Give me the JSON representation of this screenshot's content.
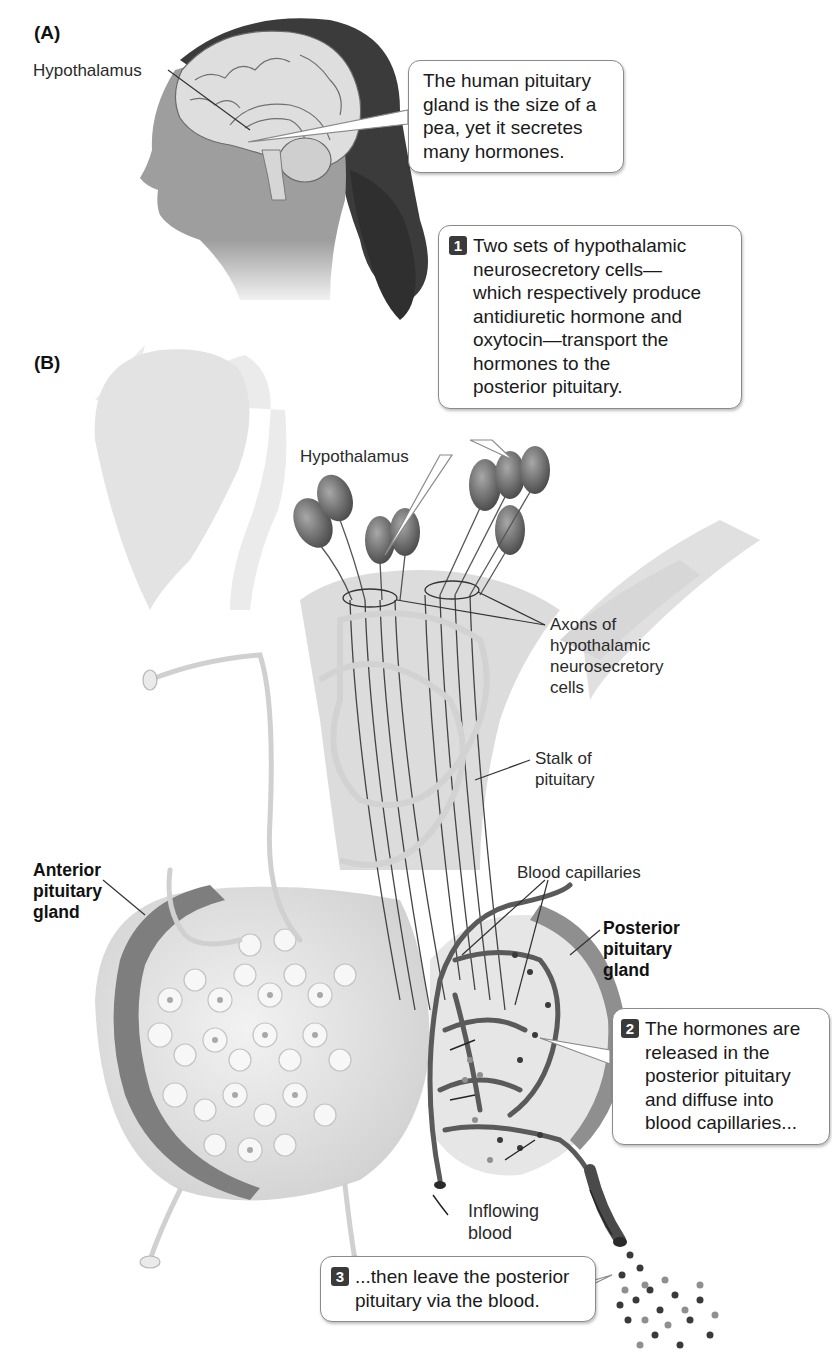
{
  "panels": {
    "a": {
      "letter": "(A)",
      "labels": {
        "hypothalamus": "Hypothalamus"
      },
      "callout": {
        "lines": [
          "The human pituitary",
          "gland is the size of a",
          "pea, yet it secretes",
          "many hormones."
        ]
      }
    },
    "b": {
      "letter": "(B)",
      "labels": {
        "hypothalamus": "Hypothalamus",
        "axons": [
          "Axons of",
          "hypothalamic",
          "neurosecretory",
          "cells"
        ],
        "stalk": [
          "Stalk of",
          "pituitary"
        ],
        "anterior": [
          "Anterior",
          "pituitary",
          "gland"
        ],
        "posterior": [
          "Posterior",
          "pituitary",
          "gland"
        ],
        "capillaries": "Blood capillaries",
        "inflowing": [
          "Inflowing",
          "blood"
        ]
      },
      "steps": [
        {
          "number": "1",
          "lines": [
            "Two sets of hypothalamic",
            "neurosecretory cells—",
            "which respectively produce",
            "antidiuretic hormone and",
            "oxytocin—transport the",
            "hormones to the",
            "posterior pituitary."
          ]
        },
        {
          "number": "2",
          "lines": [
            "The hormones are",
            "released in the",
            "posterior pituitary",
            "and diffuse into",
            "blood capillaries..."
          ]
        },
        {
          "number": "3",
          "lines": [
            "...then leave the posterior",
            "pituitary via the blood."
          ]
        }
      ]
    }
  },
  "colors": {
    "tissue_light": "#e6e6e6",
    "tissue_mid": "#cfcfcf",
    "gland_rim": "#8c8c8c",
    "vessel_dark": "#5a5a5a",
    "neuron": "#7a7a7a",
    "badge": "#3a3a3a"
  }
}
